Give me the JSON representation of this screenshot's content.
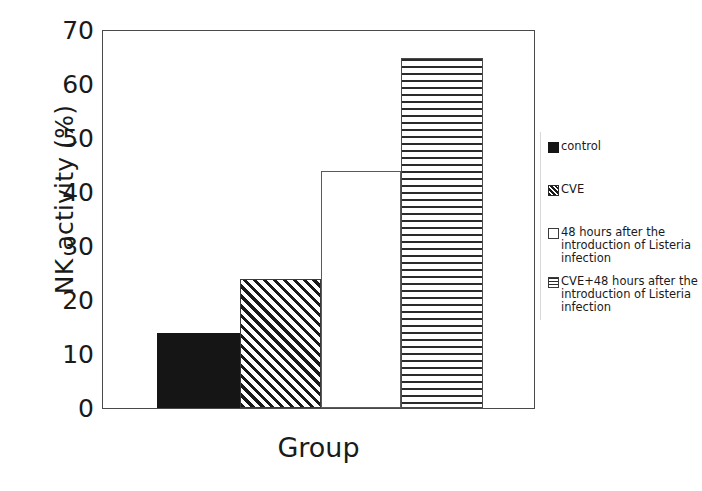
{
  "chart_data": {
    "type": "bar",
    "title": "",
    "xlabel": "Group",
    "ylabel": "NK activity (%)",
    "categories": [
      "control",
      "CVE",
      "48 hours after the introduction of Listeria infection",
      "CVE+48 hours after the introduction of Listeria infection"
    ],
    "values": [
      14,
      24,
      44,
      65
    ],
    "ylim": [
      0,
      70
    ],
    "yticks": [
      0,
      10,
      20,
      30,
      40,
      50,
      60,
      70
    ],
    "grid": false,
    "legend_position": "right",
    "bar_fills": [
      "solid-black",
      "diagonal-hatch",
      "white-empty",
      "horizontal-lines"
    ]
  },
  "axes": {
    "y_title": "NK activity (%)",
    "x_title": "Group",
    "y_tick_labels": [
      "70",
      "60",
      "50",
      "40",
      "30",
      "20",
      "10",
      "0"
    ]
  },
  "legend": {
    "entries": [
      {
        "label": "control",
        "fill": "solid-black"
      },
      {
        "label": "CVE",
        "fill": "diagonal-hatch"
      },
      {
        "label": "48 hours after the introduction of Listeria infection",
        "fill": "white-empty"
      },
      {
        "label": "CVE+48 hours after the introduction of Listeria infection",
        "fill": "horizontal-lines"
      }
    ]
  },
  "colors": {
    "bar_solid": "#151515",
    "hatch_ink": "#1a1a1a",
    "frame": "#4a4a4a",
    "background": "#ffffff",
    "text": "#1a1a1a"
  }
}
